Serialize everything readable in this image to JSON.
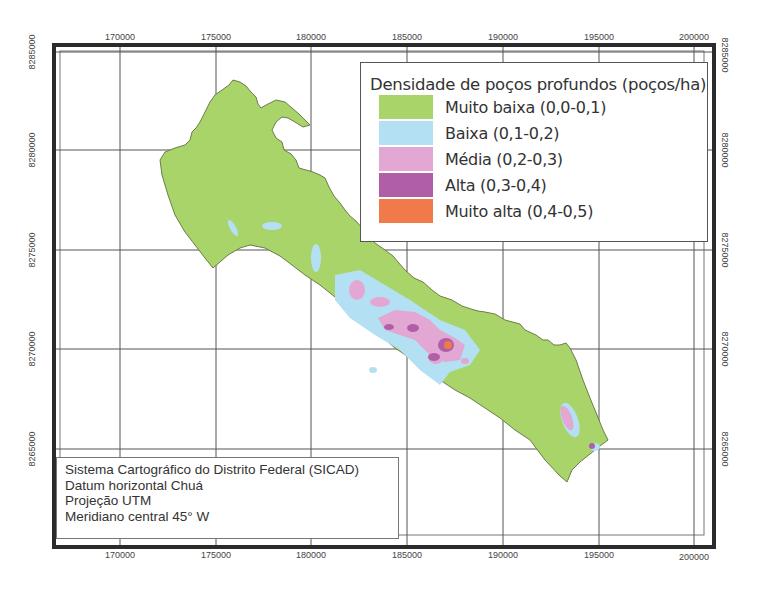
{
  "map": {
    "legend": {
      "title": "Densidade de poços profundos (poços/ha)",
      "items": [
        {
          "label": "Muito baixa (0,0-0,1)",
          "color": "#a9d46a"
        },
        {
          "label": "Baixa (0,1-0,2)",
          "color": "#b3e0f2"
        },
        {
          "label": "Média (0,2-0,3)",
          "color": "#e2a7d3"
        },
        {
          "label": "Alta (0,3-0,4)",
          "color": "#b05fa7"
        },
        {
          "label": "Muito alta (0,4-0,5)",
          "color": "#f07a4a"
        }
      ]
    },
    "info_box": {
      "lines": [
        "Sistema Cartográfico do Distrito Federal (SICAD)",
        "Datum horizontal Chuá",
        "Projeção UTM",
        "Meridiano central 45° W"
      ]
    },
    "x_ticks": [
      "170000",
      "175000",
      "180000",
      "185000",
      "190000",
      "195000",
      "200000"
    ],
    "y_ticks": [
      "8285000",
      "8280000",
      "8275000",
      "8270000",
      "8265000"
    ],
    "colors": {
      "frame": "#2b2b2b",
      "grid": "#555555",
      "region_fill": "#a9d46a",
      "region_outline": "#6b7d4a"
    }
  }
}
